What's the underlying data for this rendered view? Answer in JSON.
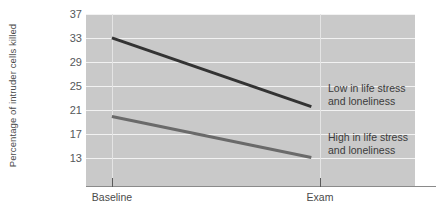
{
  "chart_data": {
    "type": "line",
    "title": "",
    "xlabel": "",
    "ylabel": "Percentage of intruder cells killed",
    "categories": [
      "Baseline",
      "Exam"
    ],
    "x": [
      0,
      1
    ],
    "xlim": [
      -0.13,
      1.52
    ],
    "ylim": [
      11,
      37
    ],
    "yticks": [
      37,
      33,
      29,
      25,
      21,
      17,
      13
    ],
    "ytick_labels": [
      "37",
      "33",
      "29",
      "25",
      "21",
      "17",
      "13"
    ],
    "grid": true,
    "legend": "inline-annotations",
    "series": [
      {
        "name": "Low in life stress and loneliness",
        "color": "#333333",
        "values": [
          33.4,
          23.0
        ],
        "annotation": {
          "line1": "Low in life stress",
          "line2": "and loneliness"
        }
      },
      {
        "name": "High in life stress and loneliness",
        "color": "#6a6a6a",
        "values": [
          21.5,
          15.3
        ],
        "annotation": {
          "line1": "High in life stress",
          "line2": "and loneliness"
        }
      }
    ]
  },
  "style": {
    "plot_background": "#c9c9c9",
    "gridline_color": "#f2f2f2",
    "axis_color": "#8a8a8a",
    "text_color": "#4a4a4a",
    "page_background": "#ffffff"
  }
}
